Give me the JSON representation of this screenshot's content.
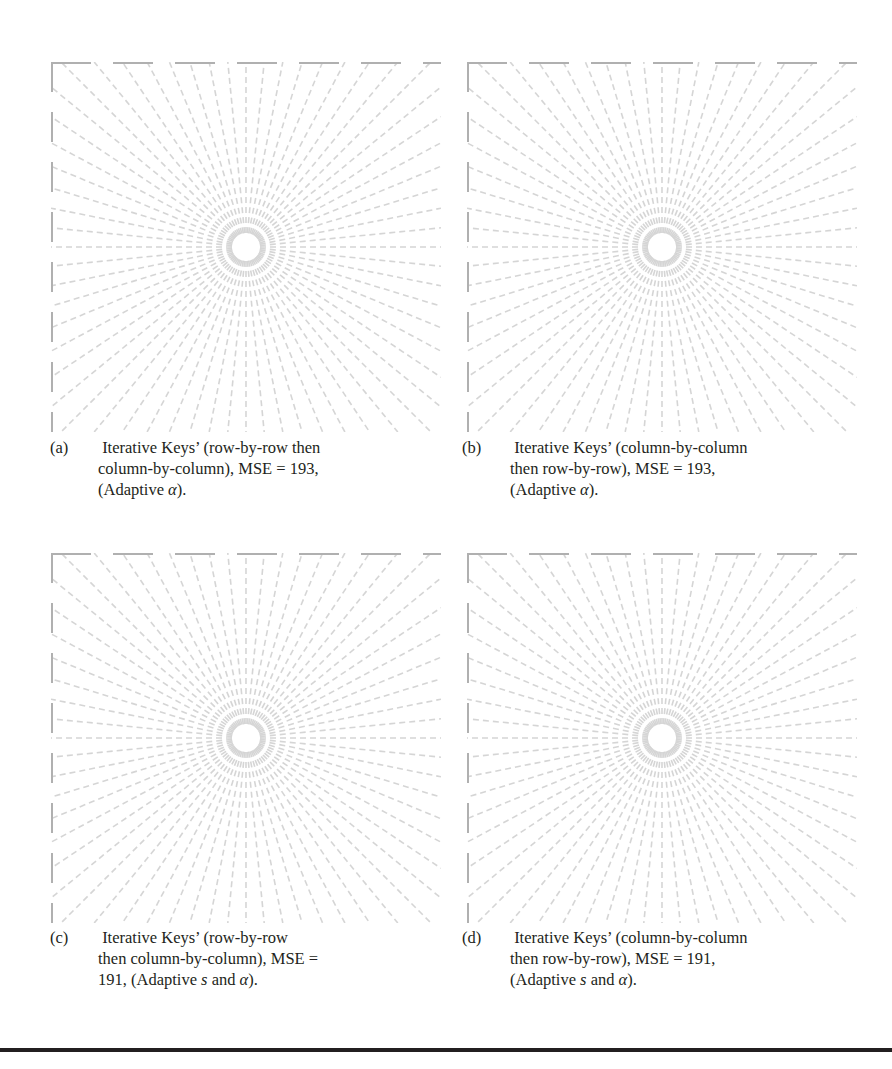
{
  "figures": [
    {
      "id": "a",
      "label": "(a)",
      "lines": [
        "Iterative Keys’ (row-by-row then",
        "column-by-column), MSE = 193,",
        "(Adaptive α)."
      ],
      "mse": 193,
      "order": "row-by-row then column-by-column",
      "adaptive": "α"
    },
    {
      "id": "b",
      "label": "(b)",
      "lines": [
        "Iterative Keys’ (column-by-column",
        "then row-by-row), MSE = 193,",
        "(Adaptive α)."
      ],
      "mse": 193,
      "order": "column-by-column then row-by-row",
      "adaptive": "α"
    },
    {
      "id": "c",
      "label": "(c)",
      "lines": [
        "Iterative Keys’ (row-by-row",
        "then column-by-column), MSE =",
        "191, (Adaptive s and α)."
      ],
      "mse": 191,
      "order": "row-by-row then column-by-column",
      "adaptive": "s and α"
    },
    {
      "id": "d",
      "label": "(d)",
      "lines": [
        "Iterative Keys’ (column-by-column",
        "then row-by-row), MSE = 191,",
        "(Adaptive s and α)."
      ],
      "mse": 191,
      "order": "column-by-column then row-by-row",
      "adaptive": "s and α"
    }
  ],
  "image_content": "starburst-radial-line-test-pattern",
  "colors": {
    "line": "#c8c8c8",
    "rule": "#231f20",
    "text": "#231f20"
  }
}
